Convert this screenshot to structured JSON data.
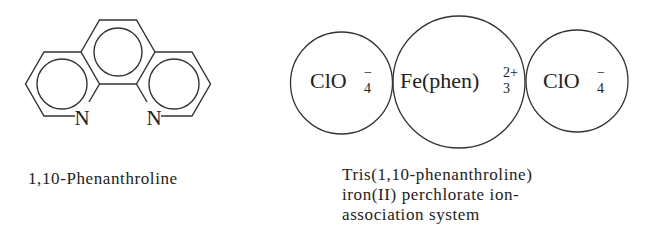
{
  "molecule": {
    "name": "1,10-Phenanthroline",
    "atom_labels": [
      "N",
      "N"
    ]
  },
  "ion_association": {
    "left_ion": {
      "base": "ClO",
      "subscript": "4",
      "superscript": "−"
    },
    "center_ion": {
      "base": "Fe(phen)",
      "subscript": "3",
      "superscript": "2+"
    },
    "right_ion": {
      "base": "ClO",
      "subscript": "4",
      "superscript": "−"
    },
    "caption_lines": [
      "Tris(1,10-phenanthroline)",
      "iron(II) perchlorate ion-",
      "association system"
    ]
  },
  "colors": {
    "ink": "#222222",
    "background": "#ffffff"
  }
}
